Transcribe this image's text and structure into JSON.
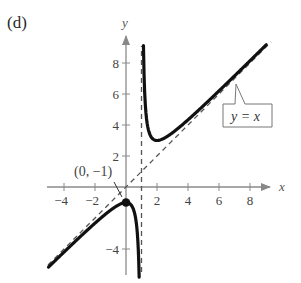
{
  "panel_label": "(d)",
  "chart_data": {
    "type": "line",
    "title": "",
    "function": "y = x + 1/(x - 1)",
    "xlabel": "x",
    "ylabel": "y",
    "xlim": [
      -5,
      9.5
    ],
    "ylim": [
      -5.8,
      9.5
    ],
    "grid": false,
    "x_ticks": [
      -4,
      -2,
      2,
      4,
      6,
      8
    ],
    "x_tick_labels": [
      "−4",
      "−2",
      "2",
      "4",
      "6",
      "8"
    ],
    "y_ticks": [
      -4,
      2,
      4,
      6,
      8
    ],
    "y_tick_labels": [
      "−4",
      "2",
      "4",
      "6",
      "8"
    ],
    "series": [
      {
        "name": "left branch",
        "style": "solid-thick",
        "x": [
          -5,
          -4,
          -3,
          -2,
          -1,
          -0.5,
          0,
          0.3,
          0.5,
          0.7,
          0.8,
          0.85
        ],
        "y": [
          -5.17,
          -4.2,
          -3.25,
          -2.33,
          -1.5,
          -1.17,
          -1,
          -1.13,
          -1.5,
          -2.63,
          -4.2,
          -5.82
        ]
      },
      {
        "name": "right branch",
        "style": "solid-thick",
        "x": [
          1.125,
          1.2,
          1.3,
          1.5,
          2,
          3,
          4,
          5,
          6,
          7,
          8,
          9
        ],
        "y": [
          9.13,
          6.2,
          4.63,
          3.5,
          3,
          3.5,
          4.33,
          5.25,
          6.2,
          7.17,
          8.14,
          9.13
        ]
      },
      {
        "name": "y = x",
        "style": "dashed",
        "x": [
          -5,
          9.3
        ],
        "y": [
          -5,
          9.3
        ]
      },
      {
        "name": "x = 1",
        "style": "dashed",
        "x": [
          1,
          1
        ],
        "y": [
          -5.8,
          9.1
        ]
      }
    ],
    "annotations": [
      {
        "text": "(0, −1)",
        "x": 0,
        "y": -1,
        "marker": "filled-circle"
      },
      {
        "text": "y = x",
        "type": "callout-box",
        "points_to": "oblique asymptote"
      }
    ]
  }
}
